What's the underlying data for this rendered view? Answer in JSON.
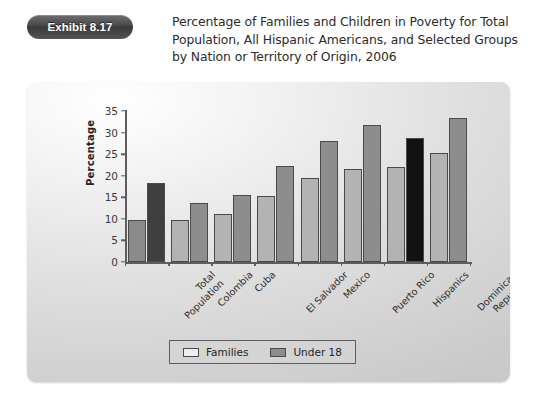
{
  "exhibit": {
    "badge_label": "Exhibit 8.17",
    "title": "Percentage of Families and Children in Poverty for Total Population, All Hispanic Americans, and Selected Groups by Nation or Territory of Origin, 2006"
  },
  "chart_data": {
    "type": "bar",
    "title": "Percentage of Families and Children in Poverty for Total Population, All Hispanic Americans, and Selected Groups by Nation or Territory of Origin, 2006",
    "xlabel": "",
    "ylabel": "Percentage",
    "ylim": [
      0,
      35
    ],
    "yticks": [
      0,
      5,
      10,
      15,
      20,
      25,
      30,
      35
    ],
    "grid": false,
    "legend_position": "bottom",
    "categories": [
      "Total Population",
      "Colombia",
      "Cuba",
      "El Salvador",
      "Mexico",
      "Puerto Rico",
      "Hispanics",
      "Dominican Republic"
    ],
    "category_lines": [
      [
        "Total",
        "Population"
      ],
      [
        "Colombia"
      ],
      [
        "Cuba"
      ],
      [
        "El Salvador"
      ],
      [
        "Mexico"
      ],
      [
        "Puerto Rico"
      ],
      [
        "Hispanics"
      ],
      [
        "Dominican",
        "Republic"
      ]
    ],
    "series": [
      {
        "name": "Families",
        "values": [
          9.8,
          9.8,
          11.2,
          15.3,
          19.4,
          21.5,
          22.1,
          25.2
        ]
      },
      {
        "name": "Under 18",
        "values": [
          18.4,
          13.7,
          15.6,
          22.3,
          28.0,
          31.7,
          28.8,
          33.4
        ]
      }
    ],
    "highlighted_categories": [
      "Total Population",
      "Hispanics"
    ],
    "colors": {
      "families": "#b3b3b3",
      "under18": "#8d8d8d",
      "families_highlight": "#8a8a8a",
      "under18_highlight": "#3f3f3f",
      "under18_black": "#121212",
      "axis": "#5d5d5d",
      "panel_background": "#dedede",
      "badge": "#4a4a4a"
    }
  },
  "legend": {
    "items": [
      {
        "label": "Families",
        "swatch": "families"
      },
      {
        "label": "Under 18",
        "swatch": "under18"
      }
    ]
  }
}
